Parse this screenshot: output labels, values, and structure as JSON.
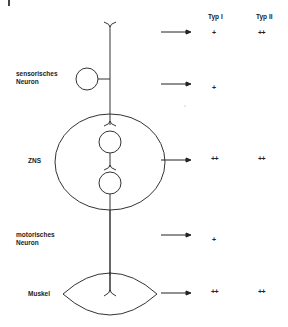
{
  "figure": {
    "corner_mark": "|",
    "columns": {
      "type1": "Typ I",
      "type2": "Typ II"
    },
    "rows": [
      {
        "id": "receptor",
        "label": "",
        "arrow_y": 32,
        "type1": "+",
        "type2": "++"
      },
      {
        "id": "sensory-neuron",
        "label_line1": "sensorisches",
        "label_line2": "Neuron",
        "arrow_y": 84,
        "type1": "+",
        "type2": ""
      },
      {
        "id": "cns",
        "label": "ZNS",
        "arrow_y": 160,
        "type1": "++",
        "type2": "++"
      },
      {
        "id": "motor-neuron",
        "label_line1": "motorisches",
        "label_line2": "Neuron",
        "arrow_y": 236,
        "type1": "+",
        "type2": ""
      },
      {
        "id": "muscle",
        "label": "Muskel",
        "arrow_y": 293,
        "type1": "++",
        "type2": "++"
      }
    ],
    "colors": {
      "line": "#333333",
      "text": "#222222",
      "background": "#ffffff"
    }
  }
}
